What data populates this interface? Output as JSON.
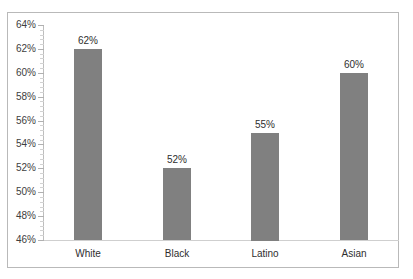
{
  "chart_data": {
    "type": "bar",
    "title": "",
    "subtitle": "",
    "xlabel": "",
    "ylabel": "",
    "categories": [
      "White",
      "Black",
      "Latino",
      "Asian"
    ],
    "values": [
      62,
      55,
      52,
      60
    ],
    "series": [
      {
        "name": "",
        "values": [
          62,
          52,
          55,
          60
        ]
      }
    ],
    "data_labels": [
      "62%",
      "52%",
      "55%",
      "60%"
    ],
    "ylim": [
      46,
      64
    ],
    "ytick_values": [
      46,
      48,
      50,
      52,
      54,
      56,
      58,
      60,
      62,
      64
    ],
    "ytick_labels": [
      "46%",
      "48%",
      "50%",
      "52%",
      "54%",
      "56%",
      "58%",
      "60%",
      "62%",
      "64%"
    ],
    "ytick_step": 2,
    "minor_ticks": true,
    "grid": false,
    "legend": false,
    "legend_position": "none",
    "value_suffix": "%",
    "bar_color": "#808080",
    "plot_background": "#ffffff",
    "frame_color": "#b9b9b9",
    "axis_color": "#bdbdbd",
    "label_color": "#2e2e2e",
    "tick_label_color": "#404040"
  }
}
